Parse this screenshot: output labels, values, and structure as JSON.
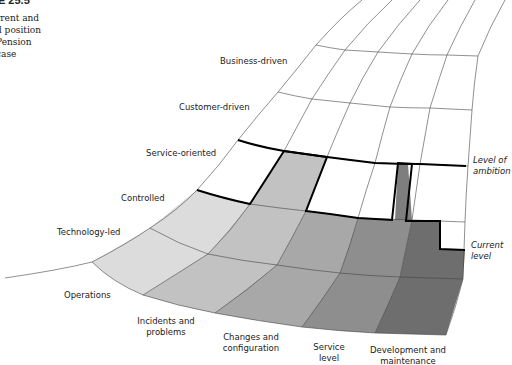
{
  "caption": {
    "figure": "RE 25.5",
    "lines": [
      "rrent and",
      "d position",
      "Pension",
      "case"
    ]
  },
  "rows": [
    "Technology-led",
    "Controlled",
    "Service-oriented",
    "Customer-driven",
    "Business-driven"
  ],
  "columns": [
    {
      "label_line1": "Operations",
      "label_line2": ""
    },
    {
      "label_line1": "Incidents and",
      "label_line2": "problems"
    },
    {
      "label_line1": "Changes and",
      "label_line2": "configuration"
    },
    {
      "label_line1": "Service",
      "label_line2": "level"
    },
    {
      "label_line1": "Development and",
      "label_line2": "maintenance"
    }
  ],
  "legend": {
    "ambition_line1": "Level of",
    "ambition_line2": "ambition",
    "current_line1": "Current",
    "current_line2": "level"
  },
  "colors": {
    "col0": "#dcdcdc",
    "col1": "#c2c2c2",
    "col2": "#a8a8a8",
    "col3": "#8e8e8e",
    "col4": "#6e6e6e",
    "line": "#444444",
    "thick": "#000000"
  }
}
